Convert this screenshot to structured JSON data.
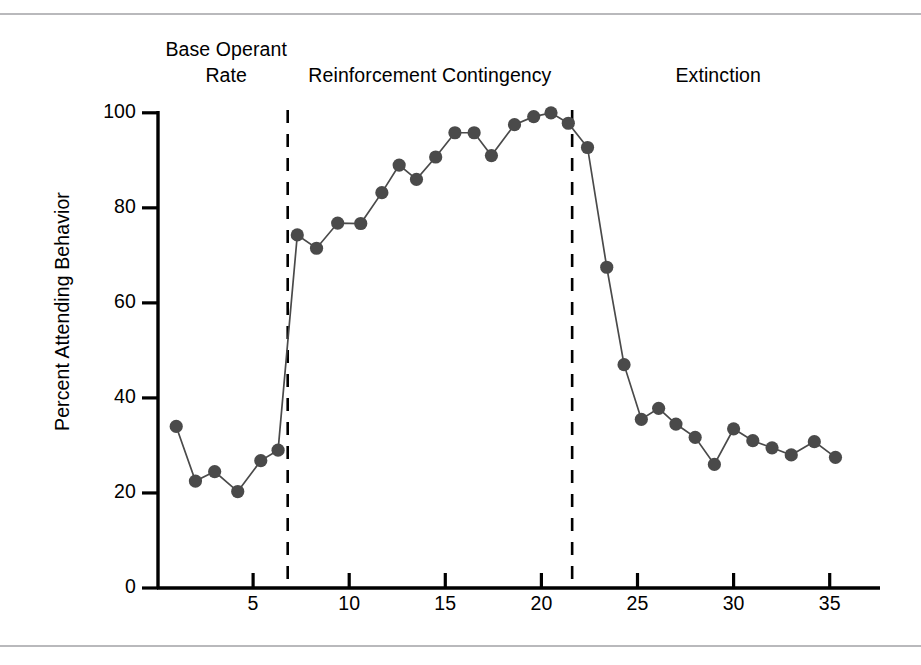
{
  "figure": {
    "top_rule": "",
    "bottom_rule": ""
  },
  "chart_data": {
    "type": "line",
    "title": "",
    "xlabel": "",
    "ylabel": "Percent Attending Behavior",
    "xlim": [
      0,
      37
    ],
    "ylim": [
      0,
      100
    ],
    "grid": false,
    "legend": "none",
    "marker": "filled-circle",
    "series_color": "#4a4a4a",
    "x_ticks": [
      5,
      10,
      15,
      20,
      25,
      30,
      35
    ],
    "y_ticks": [
      0,
      20,
      40,
      60,
      80,
      100
    ],
    "phase_labels": [
      {
        "name": "baseline",
        "text": "Base Operant\nRate",
        "x_center": 3.6
      },
      {
        "name": "reinforcement",
        "text": "Reinforcement Contingency",
        "x_center": 14.2
      },
      {
        "name": "extinction",
        "text": "Extinction",
        "x_center": 29.2
      }
    ],
    "phase_dividers": [
      {
        "name": "baseline-to-reinforcement",
        "x": 6.8
      },
      {
        "name": "reinforcement-to-extinction",
        "x": 21.6
      }
    ],
    "series": [
      {
        "name": "Percent Attending Behavior",
        "x": [
          1.0,
          2.0,
          3.0,
          4.2,
          5.4,
          6.3,
          7.3,
          8.3,
          9.4,
          10.6,
          11.7,
          12.6,
          13.5,
          14.5,
          15.5,
          16.5,
          17.4,
          18.6,
          19.6,
          20.5,
          21.4,
          22.4,
          23.4,
          24.3,
          25.2,
          26.1,
          27.0,
          28.0,
          29.0,
          30.0,
          31.0,
          32.0,
          33.0,
          34.2,
          35.3
        ],
        "y": [
          34,
          22.5,
          24.5,
          20.3,
          26.8,
          29,
          74.3,
          71.5,
          76.8,
          76.7,
          83.2,
          89,
          86,
          90.7,
          95.8,
          95.8,
          91,
          97.5,
          99.2,
          100,
          97.8,
          92.7,
          67.5,
          47,
          35.5,
          37.8,
          34.5,
          31.7,
          26,
          33.5,
          31,
          29.5,
          28,
          30.8,
          27.5
        ]
      }
    ]
  }
}
